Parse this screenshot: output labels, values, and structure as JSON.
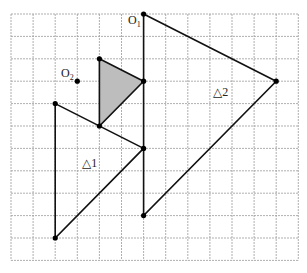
{
  "grid": {
    "cols": 13,
    "rows": 11,
    "x0": 11,
    "y0": 14,
    "dx": 22.1,
    "dy": 22.4,
    "line_color": "#9a9a9a"
  },
  "colors": {
    "stroke": "#111111",
    "shade": "#bdbdbd"
  },
  "labels": {
    "O1": "O",
    "O1_sub": "1",
    "O2": "O",
    "O2_sub": "2",
    "t1": "△1",
    "t2": "△2"
  },
  "points": {
    "O1": [
      6,
      0
    ],
    "O2": [
      3,
      3
    ],
    "shaded": [
      [
        4,
        2
      ],
      [
        6,
        3
      ],
      [
        4,
        5
      ]
    ],
    "triangle2": [
      [
        6,
        0
      ],
      [
        12,
        3
      ],
      [
        6,
        9
      ]
    ],
    "triangle1": [
      [
        2,
        4
      ],
      [
        6,
        6
      ],
      [
        2,
        10
      ]
    ]
  }
}
